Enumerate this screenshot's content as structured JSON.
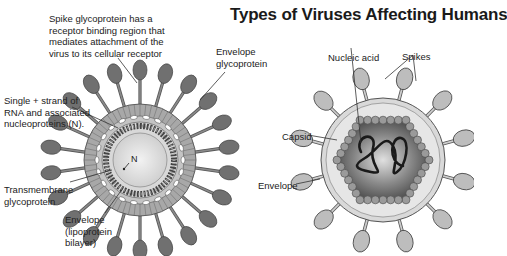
{
  "title": "Types of Viruses Affecting Humans",
  "left_virus": {
    "labels": {
      "spike": [
        "Spike glycoprotein has a",
        "receptor binding region that",
        "mediates attachment of the",
        "virus to its cellular receptor"
      ],
      "envelope_glycoprotein": [
        "Envelope",
        "glycoprotein"
      ],
      "rna": [
        "Single + strand of",
        "RNA and associated",
        "nucleoproteins (N)."
      ],
      "transmembrane": [
        "Transmembrane",
        "glycoprotein"
      ],
      "envelope": [
        "Envelope",
        "(lipoprotein",
        "bilayer)"
      ],
      "n_marker": "N"
    }
  },
  "right_virus": {
    "labels": {
      "nucleic_acid": "Nucleic acid",
      "spikes": "Spikes",
      "capsid": "Capsid",
      "envelope": "Envelope"
    }
  },
  "colors": {
    "spike_left": "#707070",
    "spike_right": "#bdbdbd",
    "envelope_left": "#a8a8a8",
    "capsid_core": "#5a5a5a",
    "line": "#333333"
  }
}
